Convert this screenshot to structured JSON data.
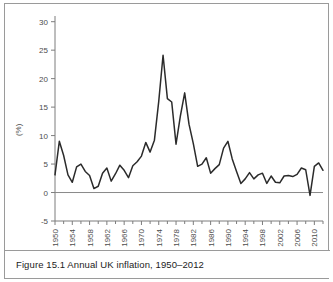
{
  "figure": {
    "caption": "Figure 15.1  Annual UK inflation, 1950–2012",
    "border_color": "#9a9a9a"
  },
  "chart_data": {
    "type": "line",
    "title": "",
    "subtitle": "",
    "xlabel": "",
    "ylabel": "(%)",
    "ylim": [
      -5,
      31
    ],
    "xlim": [
      1950,
      2012
    ],
    "grid": false,
    "legend": "none",
    "line_color": "#2b2b2b",
    "axis_color": "#7d7d7d",
    "zero_line": 0,
    "ytick_labels": [
      "30",
      "25",
      "20",
      "15",
      "10",
      "5",
      "0",
      "-5"
    ],
    "ytick_values": [
      30,
      25,
      20,
      15,
      10,
      5,
      0,
      -5
    ],
    "xtick_labels": [
      "1950",
      "1954",
      "1958",
      "1962",
      "1966",
      "1970",
      "1974",
      "1978",
      "1982",
      "1986",
      "1990",
      "1994",
      "1998",
      "2002",
      "2006",
      "2010"
    ],
    "xtick_values": [
      1950,
      1954,
      1958,
      1962,
      1966,
      1970,
      1974,
      1978,
      1982,
      1986,
      1990,
      1994,
      1998,
      2002,
      2006,
      2010
    ],
    "minor_xtick_values": [
      1952,
      1956,
      1960,
      1964,
      1968,
      1972,
      1976,
      1980,
      1984,
      1988,
      1992,
      1996,
      2000,
      2004,
      2008,
      2012
    ],
    "series": [
      {
        "name": "Annual UK inflation",
        "x": [
          1950,
          1951,
          1952,
          1953,
          1954,
          1955,
          1956,
          1957,
          1958,
          1959,
          1960,
          1961,
          1962,
          1963,
          1964,
          1965,
          1966,
          1967,
          1968,
          1969,
          1970,
          1971,
          1972,
          1973,
          1974,
          1975,
          1976,
          1977,
          1978,
          1979,
          1980,
          1981,
          1982,
          1983,
          1984,
          1985,
          1986,
          1987,
          1988,
          1989,
          1990,
          1991,
          1992,
          1993,
          1994,
          1995,
          1996,
          1997,
          1998,
          1999,
          2000,
          2001,
          2002,
          2003,
          2004,
          2005,
          2006,
          2007,
          2008,
          2009,
          2010,
          2011,
          2012
        ],
        "y": [
          3.1,
          9.0,
          6.5,
          3.1,
          1.8,
          4.5,
          5.0,
          3.7,
          3.0,
          0.7,
          1.1,
          3.4,
          4.3,
          2.0,
          3.3,
          4.8,
          3.9,
          2.6,
          4.7,
          5.4,
          6.4,
          8.8,
          7.1,
          9.2,
          16.0,
          24.1,
          16.5,
          15.9,
          8.5,
          13.4,
          17.5,
          12.0,
          8.6,
          4.6,
          5.0,
          6.1,
          3.4,
          4.2,
          4.9,
          7.8,
          9.0,
          5.9,
          3.7,
          1.6,
          2.4,
          3.5,
          2.4,
          3.1,
          3.4,
          1.6,
          2.9,
          1.8,
          1.7,
          2.9,
          3.0,
          2.8,
          3.2,
          4.3,
          4.0,
          -0.5,
          4.6,
          5.2,
          3.9
        ]
      }
    ]
  },
  "axis": {
    "y_title": "(%)"
  }
}
